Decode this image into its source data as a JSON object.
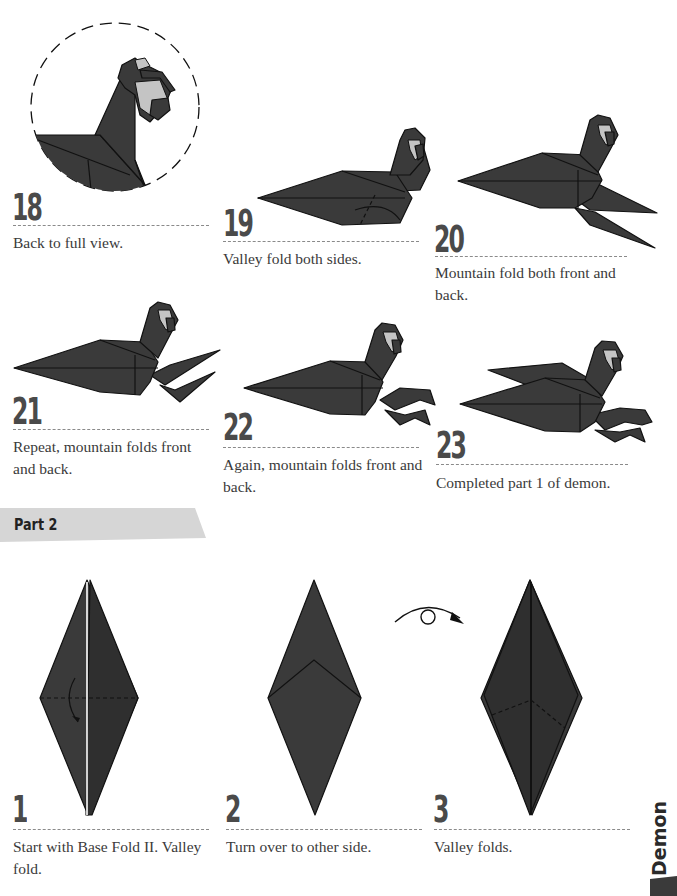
{
  "page": {
    "colors": {
      "paper": "#3a3a3a",
      "face": "#c4c4c4",
      "step_number": "#4a4a4a",
      "rule": "#8a8a8a",
      "banner": "#d6d6d6"
    }
  },
  "part1": {
    "steps": [
      {
        "number": "18",
        "text": "Back to full view."
      },
      {
        "number": "19",
        "text": "Valley fold both sides."
      },
      {
        "number": "20",
        "text": "Mountain fold both front and back."
      },
      {
        "number": "21",
        "text": "Repeat, mountain folds front and back."
      },
      {
        "number": "22",
        "text": "Again, mountain folds front and back."
      },
      {
        "number": "23",
        "text": "Completed part 1 of demon."
      }
    ]
  },
  "part2": {
    "banner_label": "Part 2",
    "turn_over_icon": "turn-over-arrow-icon",
    "steps": [
      {
        "number": "1",
        "text": "Start with Base Fold II. Valley fold."
      },
      {
        "number": "2",
        "text": "Turn over to other side."
      },
      {
        "number": "3",
        "text": "Valley folds."
      }
    ]
  },
  "side_tab": {
    "label": "Demon"
  }
}
